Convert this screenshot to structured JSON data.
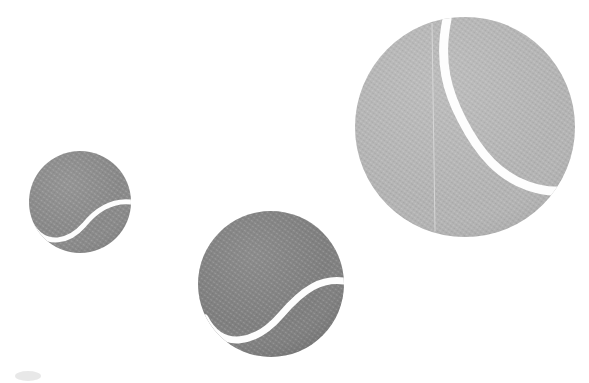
{
  "image": {
    "title": "Three tennis balls",
    "width": 589,
    "height": 383,
    "background_color": "#ffffff",
    "description": "Three grayscale tennis balls of different sizes arranged diagonally on a plain white background"
  },
  "palette": {
    "background": "#ffffff",
    "ball_small_fill": "#8a8a8a",
    "ball_medium_fill": "#808080",
    "ball_large_fill": "#b4b4b4",
    "seam_color": "#fdfdfd",
    "hairline_color": "#d6d6d6",
    "texture_color": "#9a9a9a",
    "shadow_color": "#dcdcdc"
  },
  "objects": [
    {
      "id": "ball-small",
      "label": "Small tennis ball",
      "cx": 80,
      "cy": 202,
      "r": 51,
      "fill": "#8a8a8a",
      "seam": {
        "visible": true,
        "stroke": "#fdfdfd",
        "width": 5,
        "path": "M 31 224 C 46 249 70 241 84 225 C 97 209 112 200 131 202"
      },
      "hairline": {
        "visible": false
      }
    },
    {
      "id": "ball-medium",
      "label": "Medium tennis ball",
      "cx": 271,
      "cy": 284,
      "r": 73,
      "fill": "#808080",
      "seam": {
        "visible": true,
        "stroke": "#fdfdfd",
        "width": 7,
        "path": "M 205 318 C 222 351 256 344 281 315 C 304 288 322 278 344 281"
      },
      "hairline": {
        "visible": false
      }
    },
    {
      "id": "ball-large",
      "label": "Large tennis ball",
      "cx": 465,
      "cy": 127,
      "r": 110,
      "fill": "#b4b4b4",
      "seam": {
        "visible": true,
        "stroke": "#fdfdfd",
        "width": 9,
        "path": "M 447 19 C 438 63 448 93 462 120 C 480 155 500 176 528 186 C 543 191 555 192 563 190"
      },
      "hairline": {
        "visible": true,
        "stroke": "#d6d6d6",
        "width": 1,
        "x1": 432,
        "y1": 23,
        "x2": 435,
        "y2": 231
      }
    }
  ],
  "artifacts": [
    {
      "id": "corner-smudge",
      "label": "Faint scan smudge",
      "cx": 28,
      "cy": 376,
      "rx": 13,
      "ry": 5,
      "fill": "#dcdcdc"
    }
  ],
  "chart_data": {
    "type": "scatter",
    "xlabel": "",
    "ylabel": "",
    "categories": [
      "Small ball",
      "Medium ball",
      "Large ball"
    ],
    "values": [
      51,
      73,
      110
    ],
    "x": [
      80,
      271,
      465
    ],
    "y": [
      202,
      284,
      127
    ],
    "xlim": [
      0,
      589
    ],
    "ylim": [
      0,
      383
    ],
    "grid": false,
    "legend": "none",
    "annotations": [
      "Small ball at (80, 202) radius 51, fill #8a8a8a",
      "Medium ball at (271, 284) radius 73, fill #808080",
      "Large ball at (465, 127) radius 110, fill #b4b4b4"
    ]
  }
}
